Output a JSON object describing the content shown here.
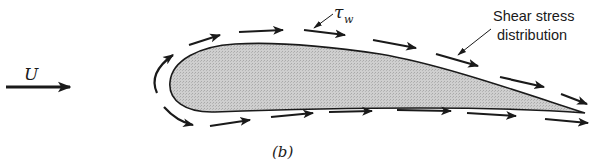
{
  "figure": {
    "label": "(b)",
    "free_stream_symbol": "U",
    "wall_shear_symbol": "τ",
    "wall_shear_subscript": "w",
    "annotation_line1": "Shear stress",
    "annotation_line2": "distribution",
    "colors": {
      "ink": "#1a1a1a",
      "airfoil_fill": "#c9c9c9",
      "background": "#ffffff"
    }
  }
}
